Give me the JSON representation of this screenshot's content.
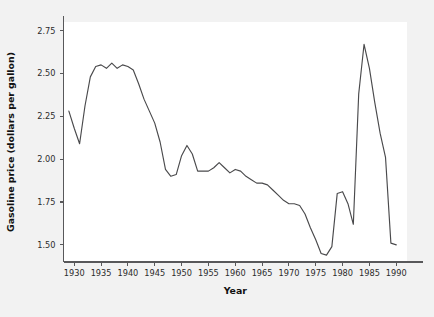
{
  "chart_data": {
    "type": "line",
    "title": "",
    "xlabel": "Year",
    "ylabel": "Gasoline price (dollars per gallon)",
    "xlim": [
      1928.0,
      1992.0
    ],
    "ylim": [
      1.4,
      2.8
    ],
    "grid": false,
    "legend": null,
    "xticks": [
      1930,
      1935,
      1940,
      1945,
      1950,
      1955,
      1960,
      1965,
      1970,
      1975,
      1980,
      1985,
      1990
    ],
    "xtick_labels": [
      "1930",
      "1935",
      "1940",
      "1945",
      "1950",
      "1955",
      "1960",
      "1965",
      "1970",
      "1975",
      "1980",
      "1985",
      "1990"
    ],
    "yticks": [
      1.5,
      1.75,
      2.0,
      2.25,
      2.5,
      2.75
    ],
    "ytick_labels": [
      "1.50",
      "1.75",
      "2.00",
      "2.25",
      "2.50",
      "2.75"
    ],
    "line_color": "#4a4a4c",
    "plot_background": "#ffffff",
    "figure_background": "#f2f2f2",
    "series": [
      {
        "name": "Gasoline price",
        "x": [
          1929,
          1930,
          1931,
          1932,
          1933,
          1934,
          1935,
          1936,
          1937,
          1938,
          1939,
          1940,
          1941,
          1942,
          1943,
          1944,
          1945,
          1946,
          1947,
          1948,
          1949,
          1950,
          1951,
          1952,
          1953,
          1954,
          1955,
          1956,
          1957,
          1958,
          1959,
          1960,
          1961,
          1962,
          1963,
          1964,
          1965,
          1966,
          1967,
          1968,
          1969,
          1970,
          1971,
          1972,
          1973,
          1974,
          1975,
          1976,
          1977,
          1978,
          1979,
          1980,
          1981,
          1982,
          1983,
          1984,
          1985,
          1986,
          1987,
          1988,
          1989,
          1990
        ],
        "y": [
          2.28,
          2.18,
          2.09,
          2.31,
          2.48,
          2.54,
          2.55,
          2.53,
          2.56,
          2.53,
          2.55,
          2.54,
          2.52,
          2.44,
          2.35,
          2.28,
          2.21,
          2.1,
          1.94,
          1.9,
          1.91,
          2.02,
          2.08,
          2.03,
          1.93,
          1.93,
          1.93,
          1.95,
          1.98,
          1.95,
          1.92,
          1.94,
          1.93,
          1.9,
          1.88,
          1.86,
          1.86,
          1.85,
          1.82,
          1.79,
          1.76,
          1.74,
          1.74,
          1.73,
          1.68,
          1.6,
          1.53,
          1.45,
          1.44,
          1.49,
          1.8,
          1.81,
          1.74,
          1.62,
          2.38,
          2.67,
          2.53,
          2.33,
          2.15,
          2.01,
          1.51,
          1.5
        ]
      }
    ]
  },
  "axes": {
    "x_title": "Year",
    "y_title": "Gasoline price (dollars per gallon)"
  }
}
